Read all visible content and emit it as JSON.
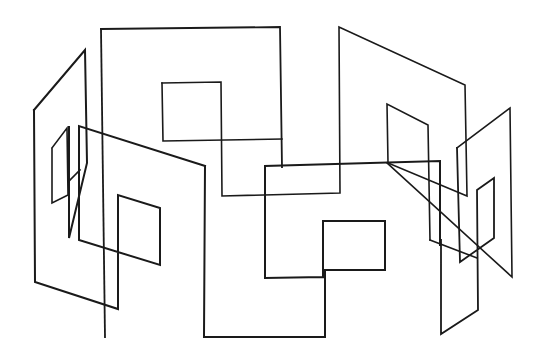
{
  "figure": {
    "background": "#ffffff",
    "stroke_color": "#1a1a1a",
    "shapes": [
      {
        "name": "left-outer-panel",
        "width": 2,
        "points": "34,110 85,50 87,163 69,238 69,127"
      },
      {
        "name": "left-outer-base",
        "width": 2,
        "points": "34,110 35,282 118,309 118,195 160,208 160,265 79,240 79,126 205,166"
      },
      {
        "name": "left-small-quad",
        "width": 1.6,
        "points": "52,148 67,128 68,195 52,203 52,148"
      },
      {
        "name": "left-top-diagonal-link",
        "width": 1.6,
        "points": "80,170 69,181"
      },
      {
        "name": "front-center-panel",
        "width": 2,
        "points": "205,166 204,337 325,337 325,270 385,270 385,221 323,221 323,277 265,278 265,166 440,161 440,245"
      },
      {
        "name": "back-center-large-panel",
        "width": 1.8,
        "points": "101,29 105,337"
      },
      {
        "name": "back-center-top",
        "width": 1.8,
        "points": "101,29 280,27 282,167"
      },
      {
        "name": "back-center-inner-square",
        "width": 1.6,
        "points": "162,83 221,82 222,196 340,193 339,27 465,85 467,196 388,163 387,104 428,125 430,240"
      },
      {
        "name": "back-center-inner-square-left",
        "width": 1.6,
        "points": "162,83 163,141 282,139"
      },
      {
        "name": "right-panel-tall",
        "width": 1.6,
        "points": "457,148 510,108 512,277 387,163"
      },
      {
        "name": "right-panel-lower",
        "width": 1.8,
        "points": "457,148 460,262 494,238 494,178 477,190 478,310 441,334 441,240"
      },
      {
        "name": "right-small-quad-link",
        "width": 1.6,
        "points": "430,240 477,258"
      }
    ]
  }
}
